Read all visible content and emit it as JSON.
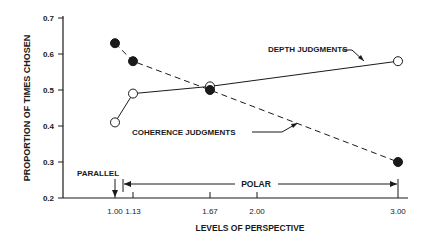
{
  "chart_data": {
    "type": "line",
    "title": "",
    "xlabel": "LEVELS OF PERSPECTIVE",
    "ylabel": "PROPORTION OF TIMES CHOSEN",
    "x": [
      1.0,
      1.13,
      1.67,
      3.0
    ],
    "x_tick_labels": [
      "1.00",
      "1.13",
      "1.67",
      "2.00",
      "3.00"
    ],
    "x_ticks": [
      1.0,
      1.13,
      1.67,
      2.0,
      3.0
    ],
    "y_tick_labels": [
      "0.2",
      "0.3",
      "0.4",
      "0.5",
      "0.6",
      "0.7"
    ],
    "ylim": [
      0.2,
      0.7
    ],
    "grid": false,
    "series": [
      {
        "name": "DEPTH JUDGMENTS",
        "marker": "open-circle",
        "line": "solid",
        "values": [
          0.41,
          0.49,
          0.51,
          0.58
        ]
      },
      {
        "name": "COHERENCE JUDGMENTS",
        "marker": "filled-circle",
        "line": "dashed",
        "values": [
          0.63,
          0.58,
          0.5,
          0.3
        ]
      }
    ],
    "annotations": [
      {
        "text": "DEPTH JUDGMENTS",
        "points_to": "solid line"
      },
      {
        "text": "COHERENCE JUDGMENTS",
        "points_to": "dashed line"
      },
      {
        "text": "PARALLEL",
        "at_x": 1.0
      },
      {
        "text": "POLAR",
        "range": [
          1.13,
          3.0
        ]
      }
    ]
  }
}
